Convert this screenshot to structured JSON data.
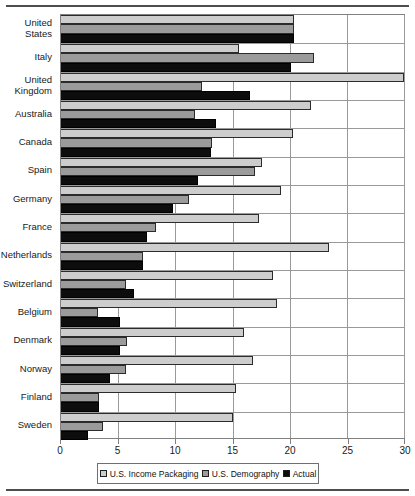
{
  "chart_data": {
    "type": "bar",
    "orientation": "horizontal",
    "title": "",
    "xlabel": "",
    "ylabel": "",
    "xlim": [
      0,
      30
    ],
    "xticks": [
      0,
      5,
      10,
      15,
      20,
      25,
      30
    ],
    "grid": true,
    "legend_position": "bottom",
    "categories": [
      "United States",
      "Italy",
      "United Kingdom",
      "Australia",
      "Canada",
      "Spain",
      "Germany",
      "France",
      "Netherlands",
      "Switzerland",
      "Belgium",
      "Denmark",
      "Norway",
      "Finland",
      "Sweden"
    ],
    "series": [
      {
        "name": "U.S. Income Packaging",
        "color": "#cdcdcd",
        "values": [
          20.4,
          15.6,
          30.0,
          21.9,
          20.3,
          17.6,
          19.2,
          17.3,
          23.4,
          18.5,
          18.9,
          16.0,
          16.8,
          15.3,
          15.0
        ]
      },
      {
        "name": "U.S. Demography",
        "color": "#9b9b9b",
        "values": [
          20.4,
          22.1,
          12.3,
          11.7,
          13.2,
          17.0,
          11.2,
          8.3,
          7.2,
          5.7,
          3.2,
          5.8,
          5.7,
          3.3,
          3.7
        ]
      },
      {
        "name": "Actual",
        "color": "#0d0d0d",
        "values": [
          20.4,
          20.1,
          16.5,
          13.6,
          13.1,
          12.0,
          9.8,
          7.5,
          7.2,
          6.4,
          5.2,
          5.2,
          4.3,
          3.3,
          2.4
        ]
      }
    ]
  },
  "legend": {
    "items": [
      {
        "label": "U.S. Income Packaging",
        "swatch": "light"
      },
      {
        "label": "U.S. Demography",
        "swatch": "medium"
      },
      {
        "label": "Actual",
        "swatch": "dark"
      }
    ]
  }
}
